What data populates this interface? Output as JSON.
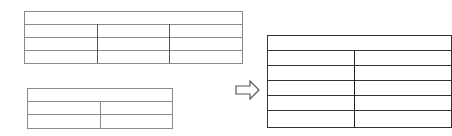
{
  "diagram": {
    "colors": {
      "source_border": "#8a8a8a",
      "target_border": "#333333",
      "arrow": "#555555",
      "background": "#ffffff"
    },
    "source_tables": [
      {
        "id": "table-1",
        "header_rows": 1,
        "body_rows": 3,
        "columns": 3,
        "cells": []
      },
      {
        "id": "table-2",
        "header_rows": 1,
        "body_rows": 2,
        "columns": 2,
        "cells": []
      }
    ],
    "arrow": {
      "icon": "right-arrow-outline-icon",
      "direction": "right"
    },
    "result_table": {
      "id": "table-merged",
      "header_rows": 1,
      "body_rows": 5,
      "columns": 2,
      "cells": []
    }
  }
}
